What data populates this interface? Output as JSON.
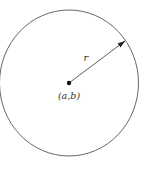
{
  "diagram": {
    "type": "circle-with-radius",
    "circle": {
      "center": {
        "x": 69,
        "y": 83
      },
      "radius_x": 69.5,
      "radius_y": 73,
      "stroke": "#555555",
      "stroke_width": 0.9
    },
    "center_point": {
      "x": 69,
      "y": 83,
      "r": 2.2,
      "fill": "#111111"
    },
    "radius_arrow": {
      "from": {
        "x": 69,
        "y": 83
      },
      "to": {
        "x": 125,
        "y": 41
      },
      "stroke": "#333333"
    },
    "labels": {
      "radius": "r",
      "center": "(a,b)"
    },
    "label_positions": {
      "radius": {
        "x": 86,
        "y": 61
      },
      "center": {
        "x": 69,
        "y": 99
      }
    }
  }
}
